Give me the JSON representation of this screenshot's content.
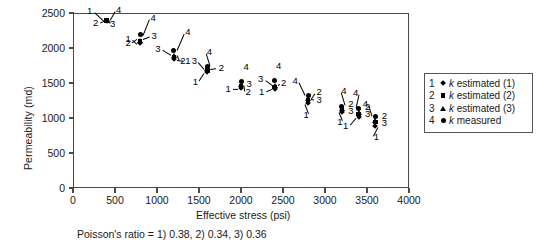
{
  "chart_data": {
    "type": "scatter",
    "title": "",
    "xlabel": "Effective stress (psi)",
    "ylabel": "Permeability (md)",
    "xlim": [
      0,
      4000
    ],
    "ylim": [
      0,
      2500
    ],
    "xticks": [
      0,
      500,
      1000,
      1500,
      2000,
      2500,
      3000,
      3500,
      4000
    ],
    "yticks": [
      0,
      500,
      1000,
      1500,
      2000,
      2500
    ],
    "grid": false,
    "legend_position": "right-outside",
    "caption": "Poisson's ratio = 1) 0.38, 2) 0.34, 3) 0.36",
    "series": [
      {
        "name": "k estimated (1)",
        "number": "1",
        "marker": "diamond",
        "x": [
          400,
          800,
          1200,
          1600,
          2000,
          2400,
          2800,
          3200,
          3400,
          3600
        ],
        "values": [
          2390,
          2070,
          1840,
          1660,
          1430,
          1420,
          1210,
          1090,
          1010,
          880
        ]
      },
      {
        "name": "k estimated (2)",
        "number": "2",
        "marker": "square",
        "x": [
          400,
          800,
          1200,
          1600,
          2000,
          2400,
          2800,
          3200,
          3400,
          3600
        ],
        "values": [
          2390,
          2090,
          1870,
          1680,
          1450,
          1440,
          1260,
          1120,
          1060,
          940
        ]
      },
      {
        "name": "k estimated (3)",
        "number": "3",
        "marker": "triangle",
        "x": [
          400,
          800,
          1200,
          1600,
          2000,
          2400,
          2800,
          3200,
          3400,
          3600
        ],
        "values": [
          2390,
          2110,
          1890,
          1700,
          1470,
          1460,
          1280,
          1140,
          1080,
          960
        ]
      },
      {
        "name": "k measured",
        "number": "4",
        "marker": "circle",
        "x": [
          400,
          800,
          1200,
          1600,
          2000,
          2400,
          2800,
          3200,
          3400,
          3600
        ],
        "values": [
          2400,
          2190,
          1970,
          1730,
          1520,
          1540,
          1320,
          1170,
          1140,
          1020
        ]
      }
    ],
    "clusters": [
      {
        "cx": 400,
        "y_low": 2380,
        "y_high": 2405,
        "lab1": "left",
        "lab4": "right"
      },
      {
        "cx": 800,
        "y_low": 2060,
        "y_high": 2190
      },
      {
        "cx": 1200,
        "y_low": 1835,
        "y_high": 1975
      },
      {
        "cx": 1600,
        "y_low": 1650,
        "y_high": 1740
      },
      {
        "cx": 2000,
        "y_low": 1420,
        "y_high": 1525
      },
      {
        "cx": 2400,
        "y_low": 1410,
        "y_high": 1545
      },
      {
        "cx": 2800,
        "y_low": 1200,
        "y_high": 1330
      },
      {
        "cx": 3200,
        "y_low": 1080,
        "y_high": 1180
      },
      {
        "cx": 3400,
        "y_low": 1000,
        "y_high": 1150
      },
      {
        "cx": 3600,
        "y_low": 870,
        "y_high": 1030
      }
    ]
  },
  "axes": {
    "y_title": "Permeability (md)",
    "x_title": "Effective stress (psi)",
    "y_tick_labels": [
      "2500",
      "2000",
      "1500",
      "1000",
      "500",
      "0"
    ],
    "x_tick_labels": [
      "0",
      "500",
      "1000",
      "1500",
      "2000",
      "2500",
      "3000",
      "3500",
      "4000"
    ]
  },
  "legend": {
    "items": [
      {
        "number": "1",
        "symbol": "diamond-marker",
        "text_plain": "k estimated (1)",
        "k": "k",
        "rest": " estimated (1)"
      },
      {
        "number": "2",
        "symbol": "square-marker",
        "text_plain": "k estimated (2)",
        "k": "k",
        "rest": " estimated (2)"
      },
      {
        "number": "3",
        "symbol": "triangle-marker",
        "text_plain": "k estimated (3)",
        "k": "k",
        "rest": " estimated (3)"
      },
      {
        "number": "4",
        "symbol": "circle-marker",
        "text_plain": "k measured",
        "k": "k",
        "rest": " measured"
      }
    ]
  },
  "footnote": {
    "text": "Poisson's ratio = 1) 0.38, 2) 0.34, 3) 0.36"
  },
  "point_labels": {
    "n1": "1",
    "n2": "2",
    "n3": "3",
    "n4": "4"
  },
  "colors": {
    "marker": "#000000",
    "axis": "#4a4a4a",
    "text": "#1a1a1a",
    "background": "#ffffff"
  }
}
